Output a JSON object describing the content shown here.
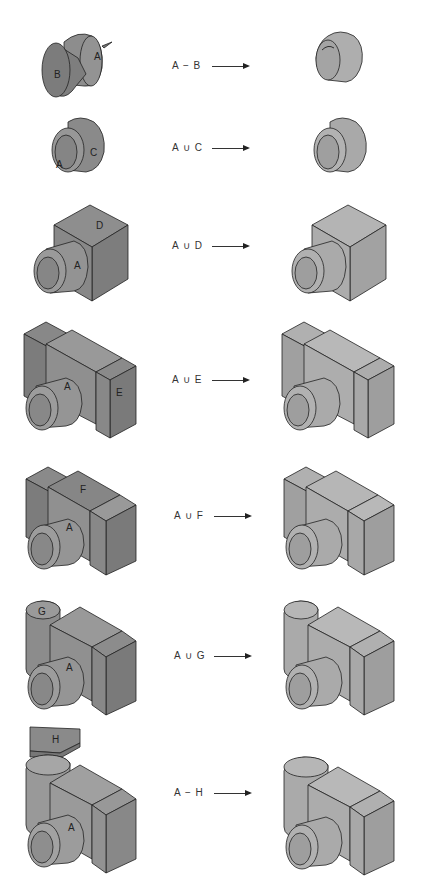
{
  "diagram": {
    "type": "constructive-solid-geometry-operations",
    "colors": {
      "input_solid": "#8c8c8c",
      "input_dark": "#7a7a7a",
      "result_solid": "#acacac",
      "result_dark": "#999999",
      "edge": "#222222",
      "text": "#333333"
    },
    "rows": [
      {
        "operation": "A − B",
        "operands": [
          "A",
          "B"
        ],
        "operator": "difference",
        "input_labels": [
          "A",
          "B"
        ],
        "result": "hollow cylinder with counterbore"
      },
      {
        "operation": "A ∪ C",
        "operands": [
          "A",
          "C"
        ],
        "operator": "union",
        "input_labels": [
          "A",
          "C"
        ],
        "result": "stepped cylinder"
      },
      {
        "operation": "A ∪ D",
        "operands": [
          "A",
          "D"
        ],
        "operator": "union",
        "input_labels": [
          "D",
          "A"
        ],
        "result": "cylinder on block"
      },
      {
        "operation": "A ∪ E",
        "operands": [
          "A",
          "E"
        ],
        "operator": "union",
        "input_labels": [
          "A",
          "E"
        ],
        "result": "camera-like body"
      },
      {
        "operation": "A ∪ F",
        "operands": [
          "A",
          "F"
        ],
        "operator": "union",
        "input_labels": [
          "F",
          "A"
        ],
        "result": "camera body with raised top"
      },
      {
        "operation": "A ∪ G",
        "operands": [
          "A",
          "G"
        ],
        "operator": "union",
        "input_labels": [
          "G",
          "A"
        ],
        "result": "camera body with rounded side"
      },
      {
        "operation": "A − H",
        "operands": [
          "A",
          "H"
        ],
        "operator": "difference",
        "input_labels": [
          "H",
          "A"
        ],
        "result": "final camera body with cut top"
      }
    ]
  }
}
